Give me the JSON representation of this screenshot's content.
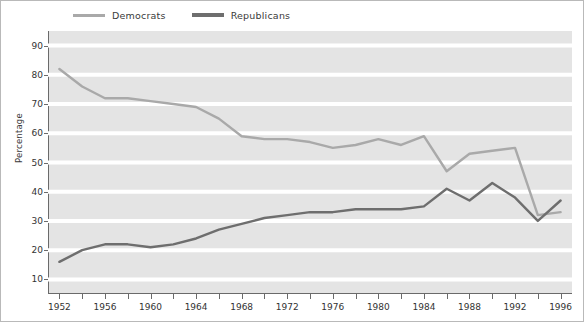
{
  "figure": {
    "width": 584,
    "height": 322,
    "background": "#ffffff",
    "border_color": "#b9b9b9"
  },
  "legend": {
    "position": "top-left",
    "entries": [
      {
        "label": "Democrats",
        "color": "#a9a9a9"
      },
      {
        "label": "Republicans",
        "color": "#6e6e6e"
      }
    ]
  },
  "axes": {
    "ylabel": "Percentage",
    "xlabel": "",
    "ylim": [
      5,
      95
    ],
    "yticks": [
      10,
      20,
      30,
      40,
      50,
      60,
      70,
      80,
      90
    ],
    "ytick_labels": [
      "10",
      "20",
      "30",
      "40",
      "50",
      "60",
      "70",
      "80",
      "90"
    ],
    "xlim": [
      1951,
      1997
    ],
    "xtick_labels": [
      "1952",
      "1956",
      "1960",
      "1964",
      "1968",
      "1972",
      "1976",
      "1980",
      "1984",
      "1988",
      "1992",
      "1996"
    ],
    "xtick_values": [
      1952,
      1956,
      1960,
      1964,
      1968,
      1972,
      1976,
      1980,
      1984,
      1988,
      1992,
      1996
    ],
    "xminor_values": [
      1954,
      1958,
      1962,
      1966,
      1970,
      1974,
      1978,
      1982,
      1986,
      1990,
      1994
    ],
    "grid": "horizontal-white",
    "grid_color": "#ffffff",
    "plot_background": "#e4e4e4",
    "spine_color": "#6a6a6a"
  },
  "chart_data": {
    "type": "line",
    "title": "",
    "xlabel": "",
    "ylabel": "Percentage",
    "ylim": [
      5,
      95
    ],
    "xlim": [
      1951,
      1997
    ],
    "grid": true,
    "legend_position": "top-left",
    "x": [
      1952,
      1954,
      1956,
      1958,
      1960,
      1962,
      1964,
      1966,
      1968,
      1970,
      1972,
      1974,
      1976,
      1978,
      1980,
      1982,
      1984,
      1986,
      1988,
      1990,
      1992,
      1994,
      1996
    ],
    "series": [
      {
        "name": "Democrats",
        "color": "#a9a9a9",
        "values": [
          82,
          76,
          72,
          72,
          71,
          70,
          69,
          65,
          59,
          58,
          58,
          57,
          55,
          56,
          58,
          56,
          59,
          47,
          53,
          54,
          55,
          32,
          33
        ]
      },
      {
        "name": "Republicans",
        "color": "#6e6e6e",
        "values": [
          16,
          20,
          22,
          22,
          21,
          22,
          24,
          27,
          29,
          31,
          32,
          33,
          33,
          34,
          34,
          34,
          35,
          41,
          37,
          43,
          38,
          30,
          37
        ]
      }
    ]
  }
}
